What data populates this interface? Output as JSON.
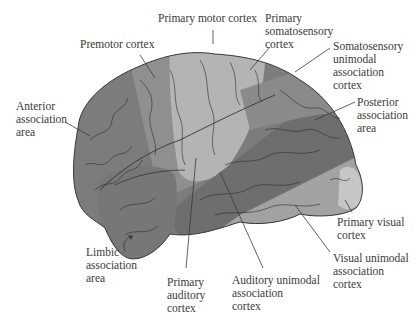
{
  "figure": {
    "colors": {
      "anterior_association": "#7c7c7c",
      "premotor": "#8f8f8f",
      "primary_motor_somatosensory": "#b4b4b4",
      "posterior_association_band": "#6e6e6e",
      "unimodal_association": "#a2a2a2",
      "primary_visual": "#c6c6c6",
      "limbic": "#777777",
      "outline": "#3a3a3a",
      "label_text": "#3a3a3a"
    }
  },
  "labels": {
    "primary_motor_cortex": "Primary motor cortex",
    "primary_somatosensory_cortex": "Primary\nsomatosensory\ncortex",
    "premotor_cortex": "Premotor cortex",
    "somatosensory_unimodal": "Somatosensory\nunimodal\nassociation\ncortex",
    "anterior_association": "Anterior\nassociation\narea",
    "posterior_association": "Posterior\nassociation\narea",
    "primary_visual_cortex": "Primary visual\ncortex",
    "visual_unimodal": "Visual unimodal\nassociation\ncortex",
    "limbic_association": "Limbic\nassociation\narea",
    "primary_auditory_cortex": "Primary\nauditory\ncortex",
    "auditory_unimodal": "Auditory unimodal\nassociation\ncortex"
  }
}
